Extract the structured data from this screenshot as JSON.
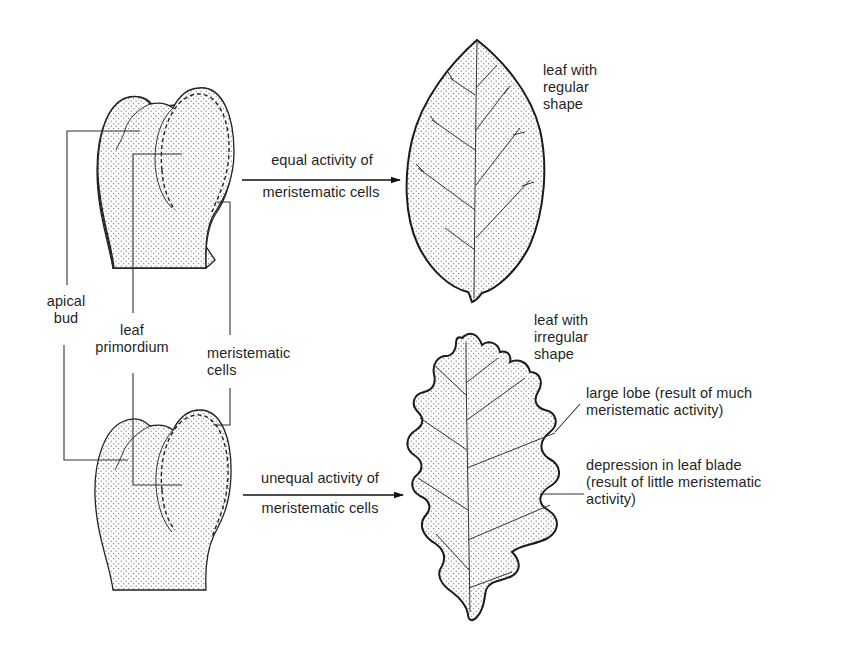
{
  "figure": {
    "colors": {
      "ink": "#1f1f1f",
      "stipple": "#6b6b6b",
      "background": "#ffffff"
    }
  },
  "top_row": {
    "arrow_label": {
      "line1": "equal activity of",
      "line2": "meristematic cells"
    },
    "result_label": {
      "line1": "leaf with",
      "line2": "regular",
      "line3": "shape"
    }
  },
  "bud_labels": {
    "apical_bud": {
      "line1": "apical",
      "line2": "bud"
    },
    "leaf_primordium": {
      "line1": "leaf",
      "line2": "primordium"
    },
    "meristematic_cells": {
      "line1": "meristematic",
      "line2": "cells"
    }
  },
  "bottom_row": {
    "arrow_label": {
      "line1": "unequal activity of",
      "line2": "meristematic cells"
    },
    "result_label": {
      "line1": "leaf with",
      "line2": "irregular",
      "line3": "shape"
    },
    "annotations": {
      "large_lobe": {
        "line1": "large lobe (result of much",
        "line2": "meristematic activity)"
      },
      "depression": {
        "line1": "depression in leaf blade",
        "line2": "(result of little meristematic",
        "line3": "activity)"
      }
    }
  }
}
